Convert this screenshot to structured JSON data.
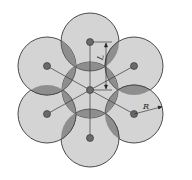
{
  "diagram": {
    "type": "hexagonal-circle-arrangement",
    "labels": {
      "spacing": "L",
      "radius": "R"
    },
    "colors": {
      "circle_fill": "#d4d4d4",
      "overlap_fill": "#8e8e8e",
      "stroke": "#3a3a3a",
      "node": "#6a6a6a",
      "background": "#ffffff"
    },
    "center": [
      90,
      90
    ],
    "outer_circle_radius": 29,
    "outer_circle_centers": [
      [
        90,
        42
      ],
      [
        134,
        66
      ],
      [
        134,
        114
      ],
      [
        90,
        138
      ],
      [
        47,
        114
      ],
      [
        47,
        66
      ]
    ],
    "inner_circle_radius": 28
  }
}
